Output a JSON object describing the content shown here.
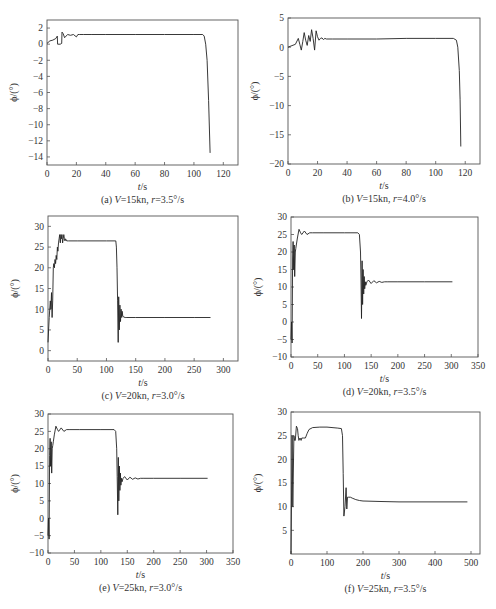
{
  "chart_data": [
    {
      "id": "a",
      "type": "line",
      "caption": "(a) V=15kn, r=3.5°/s",
      "caption_parts": {
        "label": "(a) ",
        "v": "V",
        "v_val": "=15kn, ",
        "r": "r",
        "r_val": "=3.5°/s"
      },
      "xlabel": "t/s",
      "ylabel": "ϕ/(°)",
      "xlim": [
        0,
        130
      ],
      "ylim": [
        -15,
        3
      ],
      "xticks": [
        0,
        20,
        40,
        60,
        80,
        100,
        120
      ],
      "yticks": [
        2,
        0,
        -2,
        -4,
        -6,
        -8,
        -10,
        -12,
        -14
      ],
      "grid": false,
      "frame_px": {
        "left": 47,
        "top": 20,
        "right": 238,
        "bottom": 165
      },
      "series": [
        {
          "name": "roll angle",
          "x": [
            0,
            2,
            4,
            6,
            7,
            7.2,
            9,
            10,
            10.2,
            11,
            12,
            14,
            16,
            18,
            20,
            21,
            22,
            25,
            30,
            40,
            60,
            80,
            100,
            106,
            107,
            108,
            109,
            110,
            111
          ],
          "y": [
            0.1,
            0.4,
            0.5,
            0.7,
            1.0,
            0,
            0,
            0.1,
            1.5,
            1.3,
            0.8,
            1.2,
            1.1,
            1.2,
            0.9,
            1.2,
            1.2,
            1.2,
            1.2,
            1.2,
            1.2,
            1.2,
            1.2,
            1.2,
            1.0,
            0.0,
            -2.0,
            -7.0,
            -13.5
          ]
        }
      ]
    },
    {
      "id": "b",
      "type": "line",
      "caption": "(b) V=15kn, r=4.0°/s",
      "caption_parts": {
        "label": "(b) ",
        "v": "V",
        "v_val": "=15kn, ",
        "r": "r",
        "r_val": "=4.0°/s"
      },
      "xlabel": "t/s",
      "ylabel": "ϕ/(°)",
      "xlim": [
        0,
        130
      ],
      "ylim": [
        -20,
        5
      ],
      "xticks": [
        0,
        20,
        40,
        60,
        80,
        100,
        120
      ],
      "yticks": [
        5,
        0,
        -5,
        -10,
        -15,
        -20
      ],
      "grid": false,
      "frame_px": {
        "left": 288,
        "top": 18,
        "right": 480,
        "bottom": 164
      },
      "series": [
        {
          "name": "roll angle",
          "x": [
            0,
            2,
            5,
            7,
            8,
            9,
            10,
            11,
            12,
            13,
            14,
            15,
            16,
            17,
            18,
            19,
            20,
            21,
            22,
            23,
            24,
            25,
            26,
            30,
            40,
            60,
            80,
            100,
            112,
            114,
            115,
            116,
            116.5,
            117
          ],
          "y": [
            0,
            0.2,
            0.5,
            1.5,
            0.5,
            -0.5,
            1.0,
            2.5,
            1.2,
            0.3,
            2.0,
            1.0,
            3.0,
            1.5,
            -0.5,
            2.8,
            1.8,
            1.2,
            1.5,
            1.6,
            1.3,
            1.5,
            1.4,
            1.4,
            1.4,
            1.4,
            1.5,
            1.5,
            1.5,
            1.2,
            0,
            -4,
            -9,
            -17
          ]
        }
      ]
    },
    {
      "id": "c",
      "type": "line",
      "caption": "(c) V=20kn, r=3.0°/s",
      "caption_parts": {
        "label": "(c) ",
        "v": "V",
        "v_val": "=20kn, ",
        "r": "r",
        "r_val": "=3.0°/s"
      },
      "xlabel": "t/s",
      "ylabel": "ϕ/(°)",
      "xlim": [
        0,
        325
      ],
      "ylim": [
        -2.5,
        32.5
      ],
      "xticks": [
        0,
        50,
        100,
        150,
        200,
        250,
        300
      ],
      "yticks": [
        30,
        25,
        20,
        15,
        10,
        5,
        0
      ],
      "grid": false,
      "frame_px": {
        "left": 48,
        "top": 216,
        "right": 238,
        "bottom": 361
      },
      "series": [
        {
          "name": "roll angle",
          "x": [
            0,
            2,
            4,
            5,
            6,
            7,
            8,
            9,
            10,
            11,
            12,
            13,
            14,
            15,
            16,
            17,
            18,
            19,
            20,
            21,
            22,
            23,
            24,
            25,
            26,
            27,
            28,
            29,
            30,
            32,
            35,
            50,
            100,
            116,
            117,
            118,
            119,
            120,
            121,
            122,
            123,
            124,
            125,
            126,
            127,
            128,
            130,
            132,
            135,
            150,
            200,
            250,
            278
          ],
          "y": [
            2,
            8,
            12,
            10,
            14,
            8,
            12,
            20,
            21,
            20,
            22,
            21,
            23,
            22,
            25,
            24,
            26,
            27,
            28,
            26,
            28,
            27,
            28,
            26,
            27,
            28,
            27,
            26.5,
            27,
            26.5,
            26.5,
            26.5,
            26.5,
            26.5,
            25,
            20,
            12,
            2,
            13,
            5,
            11,
            7,
            10,
            8,
            9.5,
            8.3,
            8.1,
            8,
            8,
            8,
            8,
            8,
            8
          ]
        }
      ]
    },
    {
      "id": "d",
      "type": "line",
      "caption": "(d) V=20kn, r=3.5°/s",
      "caption_parts": {
        "label": "(d) ",
        "v": "V",
        "v_val": "=20kn, ",
        "r": "r",
        "r_val": "=3.5°/s"
      },
      "xlabel": "t/s",
      "ylabel": "ϕ/(°)",
      "xlim": [
        0,
        350
      ],
      "ylim": [
        -10,
        30
      ],
      "xticks": [
        0,
        50,
        100,
        150,
        200,
        250,
        300,
        350
      ],
      "yticks": [
        30,
        25,
        20,
        15,
        10,
        5,
        0,
        -5,
        -10
      ],
      "grid": false,
      "frame_px": {
        "left": 291,
        "top": 217,
        "right": 478,
        "bottom": 357
      },
      "series": [
        {
          "name": "roll angle",
          "x": [
            0,
            1,
            2,
            3,
            4,
            5,
            6,
            7,
            8,
            9,
            10,
            12,
            15,
            18,
            20,
            25,
            30,
            35,
            40,
            60,
            100,
            125,
            128,
            130,
            131,
            132,
            133,
            134,
            135,
            136,
            137,
            138,
            139,
            140,
            142,
            145,
            150,
            155,
            160,
            165,
            170,
            175,
            180,
            200,
            250,
            302
          ],
          "y": [
            -5,
            0,
            -6,
            18,
            23,
            15,
            22,
            13,
            20,
            21,
            22,
            24,
            26.5,
            25.5,
            25,
            26,
            25,
            25.5,
            25.5,
            25.5,
            25.5,
            25.5,
            25,
            20,
            12,
            1,
            17.5,
            5,
            15,
            8,
            13,
            9.5,
            11.5,
            10.5,
            11.5,
            12,
            11,
            11.8,
            11.2,
            11.6,
            11.3,
            11.5,
            11.5,
            11.5,
            11.5,
            11.5
          ]
        }
      ]
    },
    {
      "id": "e",
      "type": "line",
      "caption": "(e) V=25kn, r=3.0°/s",
      "caption_parts": {
        "label": "(e) ",
        "v": "V",
        "v_val": "=25kn, ",
        "r": "r",
        "r_val": "=3.0°/s"
      },
      "xlabel": "t/s",
      "ylabel": "ϕ/(°)",
      "xlim": [
        0,
        350
      ],
      "ylim": [
        -10,
        30
      ],
      "xticks": [
        0,
        50,
        100,
        150,
        200,
        250,
        300,
        350
      ],
      "yticks": [
        30,
        25,
        20,
        15,
        10,
        5,
        0,
        -5,
        -10
      ],
      "grid": false,
      "frame_px": {
        "left": 48,
        "top": 414,
        "right": 233,
        "bottom": 553
      },
      "series": [
        {
          "name": "roll angle",
          "x": [
            0,
            1,
            2,
            3,
            4,
            5,
            6,
            7,
            8,
            9,
            10,
            12,
            15,
            18,
            20,
            25,
            30,
            35,
            40,
            60,
            100,
            125,
            128,
            130,
            131,
            132,
            133,
            134,
            135,
            136,
            137,
            138,
            139,
            140,
            142,
            145,
            150,
            155,
            160,
            165,
            170,
            175,
            180,
            200,
            250,
            302
          ],
          "y": [
            -5,
            0,
            -6,
            18,
            23,
            15,
            22,
            13,
            20,
            21,
            22,
            24,
            26.5,
            25.5,
            25,
            26,
            25,
            25.5,
            25.5,
            25.5,
            25.5,
            25.5,
            25,
            20,
            12,
            1,
            17.5,
            5,
            15,
            8,
            13,
            9.5,
            11.5,
            10.5,
            11.5,
            12,
            11,
            11.8,
            11.2,
            11.6,
            11.3,
            11.5,
            11.5,
            11.5,
            11.5,
            11.5
          ]
        }
      ]
    },
    {
      "id": "f",
      "type": "line",
      "caption": "(f) V=25kn, r=3.5°/s",
      "caption_parts": {
        "label": "(f) ",
        "v": "V",
        "v_val": "=25kn, ",
        "r": "r",
        "r_val": "=3.5°/s"
      },
      "xlabel": "t/s",
      "ylabel": "ϕ/(°)",
      "xlim": [
        0,
        525
      ],
      "ylim": [
        0,
        30
      ],
      "xticks": [
        0,
        100,
        200,
        300,
        400,
        500
      ],
      "yticks": [
        30,
        25,
        20,
        15,
        10,
        5
      ],
      "grid": false,
      "frame_px": {
        "left": 291,
        "top": 412,
        "right": 480,
        "bottom": 554
      },
      "series": [
        {
          "name": "roll angle",
          "x": [
            0,
            3,
            5,
            8,
            10,
            12,
            15,
            18,
            20,
            22,
            25,
            28,
            30,
            35,
            40,
            45,
            50,
            60,
            80,
            100,
            130,
            140,
            143,
            145,
            147,
            150,
            153,
            155,
            157,
            160,
            165,
            170,
            180,
            190,
            200,
            250,
            300,
            400,
            490
          ],
          "y": [
            0,
            25,
            10,
            25,
            24,
            24,
            27,
            26.5,
            25,
            24,
            24.5,
            24,
            24.5,
            24.5,
            24.5,
            25.5,
            26.3,
            26.7,
            26.8,
            26.8,
            26.6,
            26.5,
            25,
            17,
            8,
            10,
            14,
            9.5,
            12,
            12,
            12,
            11.8,
            11.5,
            11.3,
            11.2,
            11.1,
            11,
            11,
            11
          ]
        }
      ]
    }
  ]
}
